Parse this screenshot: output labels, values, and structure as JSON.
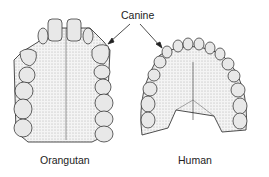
{
  "labels": {
    "pointer": "Canine",
    "left": "Orangutan",
    "right": "Human"
  },
  "colors": {
    "ink": "#222222",
    "fill": "#f2f2f2",
    "tooth": "#e4e4e4"
  }
}
